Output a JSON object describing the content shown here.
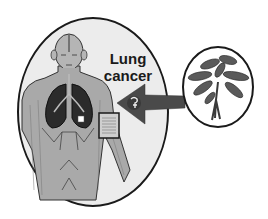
{
  "figure": {
    "label": {
      "line1": "Lung",
      "line2": "cancer"
    },
    "elements": {
      "patient_ellipse": "human-torso-with-lungs",
      "plant_circle": "medicinal-plant",
      "arrow": "arrow-from-plant-to-patient",
      "arrow_icon": "compound-structure-icon",
      "document_box": "prescription-document",
      "tumor_marker": "white-square-marker"
    },
    "colors": {
      "outline": "#1a1a1a",
      "ellipse_fill": "#ececec",
      "body_fill": "#a9a9a9",
      "lungs_fill": "#2b2b2b",
      "arrow_fill": "#4a4a4a",
      "plant_fill": "#5a5a5a",
      "background": "#ffffff"
    }
  }
}
